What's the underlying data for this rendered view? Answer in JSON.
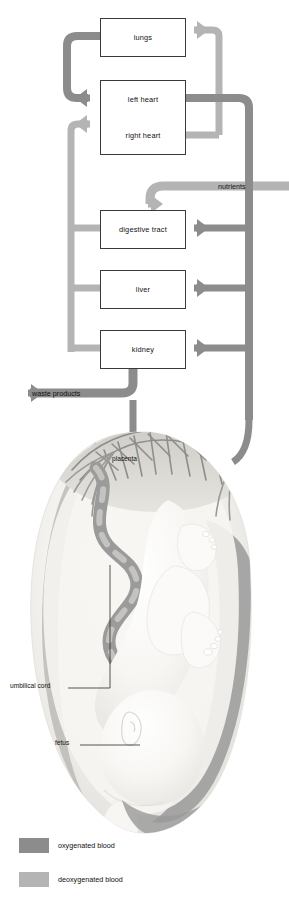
{
  "diagram": {
    "type": "flow-diagram-with-anatomical-illustration"
  },
  "colors": {
    "oxygenated": "#8c8c8c",
    "deoxygenated": "#b4b4b4",
    "box_border": "#3a3a3a",
    "box_fill": "#ffffff",
    "text": "#111111",
    "illustration_light": "#f0efec",
    "illustration_mid": "#d8d6d1",
    "illustration_vessel_dark": "#8f8f8f",
    "illustration_vessel_light": "#b9b9b9"
  },
  "boxes": [
    {
      "id": "lungs",
      "label": "lungs"
    },
    {
      "id": "left-heart",
      "label": "left heart"
    },
    {
      "id": "right-heart",
      "label": "right heart"
    },
    {
      "id": "digestive-tract",
      "label": "digestive tract"
    },
    {
      "id": "liver",
      "label": "liver"
    },
    {
      "id": "kidney",
      "label": "kidney"
    }
  ],
  "flow_labels": [
    {
      "id": "nutrients",
      "label": "nutrients"
    },
    {
      "id": "waste-products",
      "label": "waste products"
    }
  ],
  "illustration_labels": [
    {
      "id": "placenta",
      "label": "placenta"
    },
    {
      "id": "umbilical-cord",
      "label": "umbilical cord"
    },
    {
      "id": "fetus",
      "label": "fetus"
    }
  ],
  "legend": {
    "items": [
      {
        "id": "oxygenated",
        "label": "oxygenated blood",
        "color": "#8c8c8c"
      },
      {
        "id": "deoxygenated",
        "label": "deoxygenated blood",
        "color": "#b4b4b4"
      }
    ]
  },
  "flows": [
    {
      "from": "right-heart",
      "to": "lungs",
      "blood": "deoxygenated"
    },
    {
      "from": "lungs",
      "to": "left-heart",
      "blood": "oxygenated"
    },
    {
      "from": "left-heart",
      "to": "digestive-tract",
      "blood": "oxygenated"
    },
    {
      "from": "left-heart",
      "to": "liver",
      "blood": "oxygenated"
    },
    {
      "from": "left-heart",
      "to": "kidney",
      "blood": "oxygenated"
    },
    {
      "from": "digestive-tract",
      "to": "right-heart",
      "blood": "deoxygenated"
    },
    {
      "from": "liver",
      "to": "right-heart",
      "blood": "deoxygenated"
    },
    {
      "from": "kidney",
      "to": "right-heart",
      "blood": "deoxygenated"
    },
    {
      "from": "placenta",
      "to": "digestive-tract",
      "blood": "deoxygenated",
      "label": "nutrients"
    },
    {
      "from": "kidney",
      "to": "placenta",
      "blood": "deoxygenated",
      "label": "waste products"
    }
  ]
}
